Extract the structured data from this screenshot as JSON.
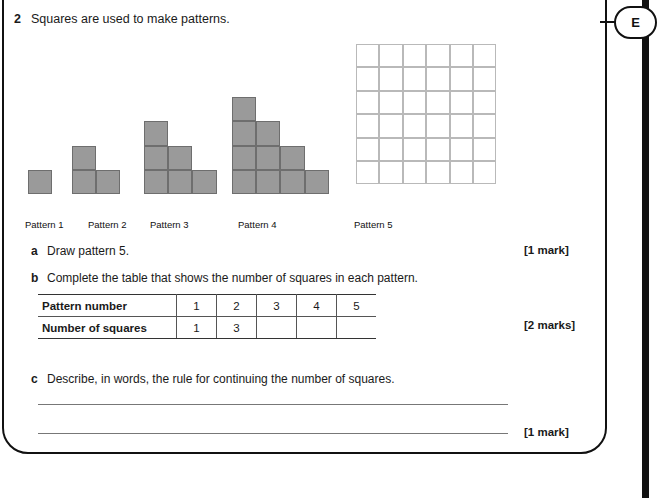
{
  "grade_tab": {
    "label": "E"
  },
  "question": {
    "number": "2",
    "stem": "Squares are used to make patterns."
  },
  "patterns": {
    "labels": [
      "Pattern 1",
      "Pattern 2",
      "Pattern 3",
      "Pattern 4",
      "Pattern 5"
    ],
    "column_heights": [
      [
        1
      ],
      [
        2,
        1
      ],
      [
        3,
        2,
        1
      ],
      [
        4,
        3,
        2,
        1
      ],
      []
    ],
    "square_counts": [
      1,
      3,
      6,
      10,
      15
    ],
    "fill_color": "#9a9a9a",
    "stroke_color": "#6e6e6e",
    "blank_grid": {
      "columns": 6,
      "rows": 6,
      "line_color": "#b9b9b9"
    }
  },
  "parts": {
    "a": {
      "letter": "a",
      "text": "Draw pattern 5.",
      "mark": "[1 mark]"
    },
    "b": {
      "letter": "b",
      "text": "Complete the table that shows the number of squares in each pattern.",
      "mark": "[2 marks]"
    },
    "c": {
      "letter": "c",
      "text": "Describe, in words, the rule for continuing the number of squares.",
      "mark": "[1 mark]"
    }
  },
  "table": {
    "row_headers": [
      "Pattern number",
      "Number of squares"
    ],
    "pattern_numbers": [
      "1",
      "2",
      "3",
      "4",
      "5"
    ],
    "number_of_squares": [
      "1",
      "3",
      "",
      "",
      ""
    ]
  },
  "answer_lines": 2
}
